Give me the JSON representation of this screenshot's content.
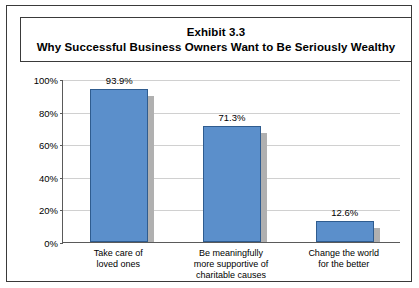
{
  "title": {
    "line1": "Exhibit 3.3",
    "line2": "Why Successful Business Owners Want to Be Seriously Wealthy"
  },
  "chart_data": {
    "type": "bar",
    "categories": [
      "Take care of loved ones",
      "Be meaningfully more supportive of charitable causes",
      "Change the world for the better"
    ],
    "category_lines": [
      [
        "Take care of",
        "loved ones"
      ],
      [
        "Be meaningfully",
        "more supportive of",
        "charitable causes"
      ],
      [
        "Change the world",
        "for the better"
      ]
    ],
    "values": [
      93.9,
      71.3,
      12.6
    ],
    "value_labels": [
      "93.9%",
      "71.3%",
      "12.6%"
    ],
    "xlabel": "",
    "ylabel": "",
    "ylim": [
      0,
      100
    ],
    "yticks": [
      0,
      20,
      40,
      60,
      80,
      100
    ],
    "ytick_labels": [
      "0%",
      "20%",
      "40%",
      "60%",
      "80%",
      "100%"
    ],
    "grid": true,
    "legend": "none",
    "bar_color": "#5b8fcb",
    "bar_border_color": "#2f5c8f",
    "shadow_color": "#b0b0b0",
    "axis_color": "#5a5a5a",
    "grid_color": "#d0d0d0"
  }
}
